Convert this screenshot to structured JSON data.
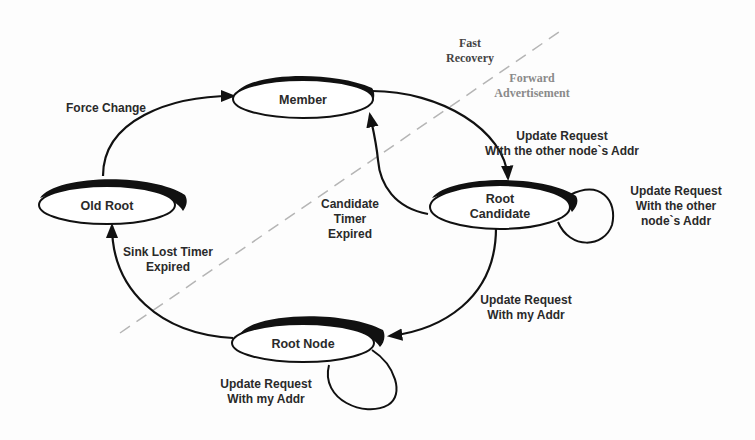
{
  "diagram": {
    "type": "state-transition",
    "states": [
      {
        "id": "member",
        "label": "Member"
      },
      {
        "id": "old_root",
        "label": "Old Root"
      },
      {
        "id": "root_candidate",
        "label_line1": "Root",
        "label_line2": "Candidate"
      },
      {
        "id": "root_node",
        "label": "Root Node"
      }
    ],
    "transitions": [
      {
        "from": "old_root",
        "to": "member",
        "label": "Force Change"
      },
      {
        "from": "member",
        "to": "root_candidate",
        "label_line1": "Update Request",
        "label_line2": "With the other node`s Addr"
      },
      {
        "from": "root_candidate",
        "to": "root_candidate",
        "label_line1": "Update Request",
        "label_line2": "With the other",
        "label_line3": "node`s Addr"
      },
      {
        "from": "root_candidate",
        "to": "member",
        "label_line1": "Candidate",
        "label_line2": "Timer",
        "label_line3": "Expired"
      },
      {
        "from": "root_candidate",
        "to": "root_node",
        "label_line1": "Update Request",
        "label_line2": "With my Addr"
      },
      {
        "from": "root_node",
        "to": "root_node",
        "label_line1": "Update Request",
        "label_line2": "With my Addr"
      },
      {
        "from": "root_node",
        "to": "old_root",
        "label_line1": "Sink Lost Timer",
        "label_line2": "Expired"
      }
    ],
    "regions": {
      "fast_recovery": {
        "line1": "Fast",
        "line2": "Recovery"
      },
      "forward_advertisement": {
        "line1": "Forward",
        "line2": "Advertisement"
      }
    },
    "colors": {
      "stroke": "#111111",
      "text": "#2a2a2a",
      "dashed_divider": "#b5b5b5",
      "forward_text": "#8a8a8a",
      "fast_text": "#444444"
    }
  }
}
